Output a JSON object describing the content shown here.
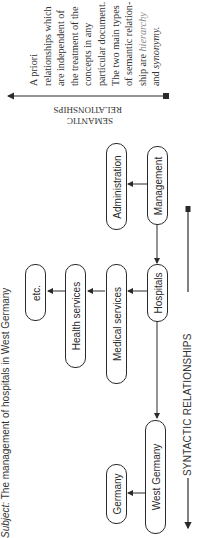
{
  "subject": {
    "prefix": "Subject:",
    "text": "The management of hospitals in West Germany"
  },
  "nodes": {
    "etc": "etc.",
    "health_services": "Health services",
    "medical_services": "Medical services",
    "hospitals": "Hospitals",
    "germany": "Germany",
    "west_germany": "West Germany",
    "administration": "Administration",
    "management": "Management"
  },
  "semantic": {
    "label_line1": "SEMANTIC",
    "label_line2": "RELATIONSHIPS",
    "description_lines": [
      "A priori",
      "relationships which",
      "are independent of",
      "the treatment of the",
      "concepts in any",
      "particular document.",
      "The two main types",
      "of semantic relation-"
    ],
    "description_line9_prefix": "ship are ",
    "description_line9_emph": "hierarchy",
    "description_line10_prefix": "and ",
    "description_line10_emph": "synonymy."
  },
  "syntactic": {
    "label": "SYNTACTIC RELATIONSHIPS"
  },
  "colors": {
    "ink": "#2a2a2a",
    "background": "#ffffff",
    "emphasis": "#888888"
  }
}
